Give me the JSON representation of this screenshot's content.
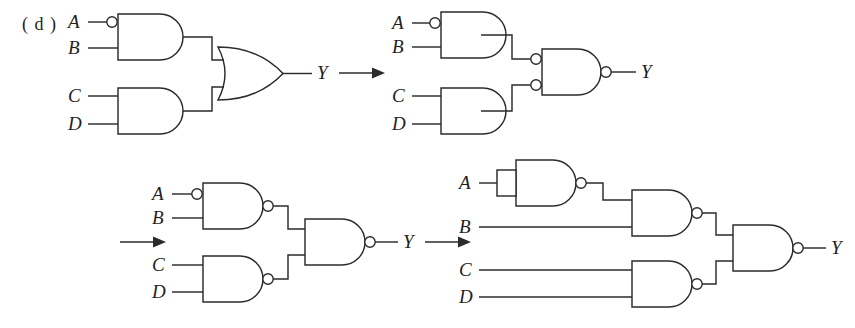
{
  "figure": {
    "part_label": "( d )",
    "caption_alt": "Logic circuit transformation sequence for part (d)",
    "ink_color": "#2b2b2b",
    "background_color": "#ffffff"
  },
  "arrows": [
    {
      "name": "arrow-stage1-to-stage2",
      "symbol": "→"
    },
    {
      "name": "arrow-stage2-to-stage3",
      "symbol": "→"
    },
    {
      "name": "arrow-stage3-to-stage4",
      "symbol": "→"
    }
  ],
  "stages": [
    {
      "id": "stage-1",
      "index": 1,
      "description": "AND-OR form with inverted A input",
      "inputs": [
        "A",
        "B",
        "C",
        "D"
      ],
      "output": "Y",
      "gates": [
        {
          "name": "and-gate-ab",
          "type": "AND",
          "inputs": [
            "A",
            "B"
          ],
          "input_bubbles": [
            true,
            false
          ],
          "output_bubble": false
        },
        {
          "name": "and-gate-cd",
          "type": "AND",
          "inputs": [
            "C",
            "D"
          ],
          "input_bubbles": [
            false,
            false
          ],
          "output_bubble": false
        },
        {
          "name": "or-gate-output",
          "type": "OR",
          "inputs": [
            "and-gate-ab",
            "and-gate-cd"
          ],
          "input_bubbles": [
            false,
            false
          ],
          "output_bubble": false
        }
      ]
    },
    {
      "id": "stage-2",
      "index": 2,
      "description": "AND gates feeding NAND with bubbled inputs",
      "inputs": [
        "A",
        "B",
        "C",
        "D"
      ],
      "output": "Y",
      "gates": [
        {
          "name": "and-gate-ab",
          "type": "AND",
          "inputs": [
            "A",
            "B"
          ],
          "input_bubbles": [
            true,
            false
          ],
          "output_bubble": false
        },
        {
          "name": "and-gate-cd",
          "type": "AND",
          "inputs": [
            "C",
            "D"
          ],
          "input_bubbles": [
            false,
            false
          ],
          "output_bubble": false
        },
        {
          "name": "nand-gate-output",
          "type": "NAND",
          "inputs": [
            "and-gate-ab",
            "and-gate-cd"
          ],
          "input_bubbles": [
            true,
            true
          ],
          "output_bubble": true
        }
      ]
    },
    {
      "id": "stage-3",
      "index": 3,
      "description": "All-NAND form",
      "inputs": [
        "A",
        "B",
        "C",
        "D"
      ],
      "output": "Y",
      "gates": [
        {
          "name": "nand-gate-ab",
          "type": "NAND",
          "inputs": [
            "A",
            "B"
          ],
          "input_bubbles": [
            true,
            false
          ],
          "output_bubble": true
        },
        {
          "name": "nand-gate-cd",
          "type": "NAND",
          "inputs": [
            "C",
            "D"
          ],
          "input_bubbles": [
            false,
            false
          ],
          "output_bubble": true
        },
        {
          "name": "nand-gate-output",
          "type": "NAND",
          "inputs": [
            "nand-gate-ab",
            "nand-gate-cd"
          ],
          "input_bubbles": [
            false,
            false
          ],
          "output_bubble": true
        }
      ]
    },
    {
      "id": "stage-4",
      "index": 4,
      "description": "All-NAND form with NAND wired as inverter for A",
      "inputs": [
        "A",
        "B",
        "C",
        "D"
      ],
      "output": "Y",
      "gates": [
        {
          "name": "nand-gate-inverter-a",
          "type": "NAND-INVERTER",
          "inputs": [
            "A"
          ],
          "input_bubbles": [
            false
          ],
          "output_bubble": true,
          "inputs_tied": true
        },
        {
          "name": "nand-gate-ab",
          "type": "NAND",
          "inputs": [
            "nand-gate-inverter-a",
            "B"
          ],
          "input_bubbles": [
            false,
            false
          ],
          "output_bubble": true
        },
        {
          "name": "nand-gate-cd",
          "type": "NAND",
          "inputs": [
            "C",
            "D"
          ],
          "input_bubbles": [
            false,
            false
          ],
          "output_bubble": true
        },
        {
          "name": "nand-gate-output",
          "type": "NAND",
          "inputs": [
            "nand-gate-ab",
            "nand-gate-cd"
          ],
          "input_bubbles": [
            false,
            false
          ],
          "output_bubble": true
        }
      ]
    }
  ],
  "labels": {
    "s1": {
      "A": "A",
      "B": "B",
      "C": "C",
      "D": "D",
      "Y": "Y"
    },
    "s2": {
      "A": "A",
      "B": "B",
      "C": "C",
      "D": "D",
      "Y": "Y"
    },
    "s3": {
      "A": "A",
      "B": "B",
      "C": "C",
      "D": "D",
      "Y": "Y"
    },
    "s4": {
      "A": "A",
      "B": "B",
      "C": "C",
      "D": "D",
      "Y": "Y"
    }
  }
}
